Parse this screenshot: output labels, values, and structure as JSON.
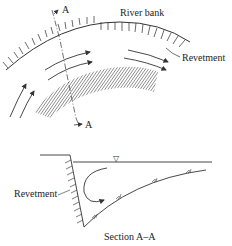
{
  "plan_view": {
    "labels": {
      "river_bank": "River bank",
      "revetment": "Revetment",
      "section_marker_top": "A",
      "section_marker_bottom": "A"
    }
  },
  "section_view": {
    "labels": {
      "revetment": "Revetment",
      "title": "Section A–A"
    },
    "water_level_symbol": "▽"
  },
  "colors": {
    "line": "#333333",
    "text": "#222222",
    "background": "#ffffff"
  }
}
